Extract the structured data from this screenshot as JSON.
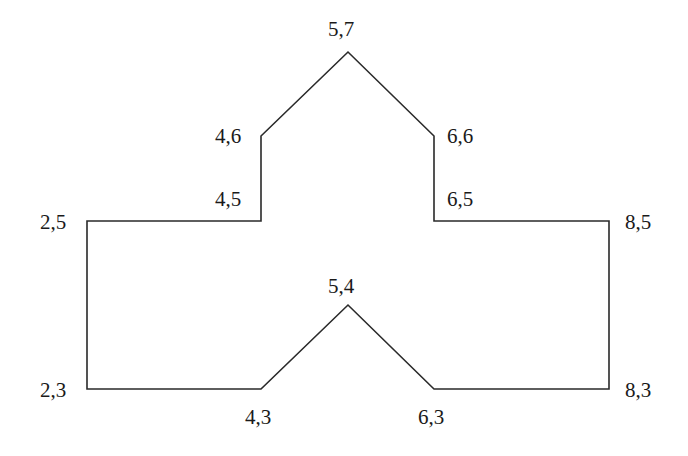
{
  "figure": {
    "stroke_color": "#2a2a2a",
    "vertices": [
      {
        "label": "2,5",
        "x": 87,
        "y": 221,
        "lx": 40,
        "ly": 229
      },
      {
        "label": "4,5",
        "x": 261,
        "y": 221,
        "lx": 215,
        "ly": 206
      },
      {
        "label": "4,6",
        "x": 261,
        "y": 136,
        "lx": 215,
        "ly": 143
      },
      {
        "label": "5,7",
        "x": 348,
        "y": 52,
        "lx": 328,
        "ly": 36
      },
      {
        "label": "6,6",
        "x": 434,
        "y": 136,
        "lx": 447,
        "ly": 143
      },
      {
        "label": "6,5",
        "x": 434,
        "y": 221,
        "lx": 447,
        "ly": 206
      },
      {
        "label": "8,5",
        "x": 609,
        "y": 221,
        "lx": 625,
        "ly": 229
      },
      {
        "label": "8,3",
        "x": 609,
        "y": 389,
        "lx": 625,
        "ly": 397
      },
      {
        "label": "6,3",
        "x": 434,
        "y": 389,
        "lx": 418,
        "ly": 424
      },
      {
        "label": "5,4",
        "x": 348,
        "y": 305,
        "lx": 328,
        "ly": 293
      },
      {
        "label": "4,3",
        "x": 261,
        "y": 389,
        "lx": 245,
        "ly": 424
      },
      {
        "label": "2,3",
        "x": 87,
        "y": 389,
        "lx": 40,
        "ly": 397
      }
    ]
  }
}
